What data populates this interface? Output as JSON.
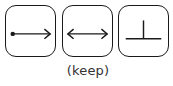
{
  "buttons": [
    {
      "name": "point-to-arrow",
      "icon": "dot-arrow-right-icon"
    },
    {
      "name": "double-arrow",
      "icon": "double-headed-arrow-icon"
    },
    {
      "name": "perpendicular",
      "icon": "perpendicular-icon"
    }
  ],
  "caption": "(keep)",
  "colors": {
    "stroke": "#1a1a1a",
    "background": "#ffffff"
  }
}
